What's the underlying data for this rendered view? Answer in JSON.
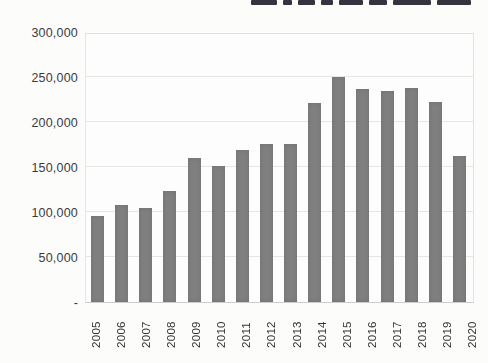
{
  "chart_data": {
    "type": "bar",
    "title": "",
    "title_note": "title cropped out of frame; only bottom sliver of bold letters visible",
    "xlabel": "",
    "ylabel": "",
    "categories": [
      "2005",
      "2006",
      "2007",
      "2008",
      "2009",
      "2010",
      "2011",
      "2012",
      "2013",
      "2014",
      "2015",
      "2016",
      "2017",
      "2018",
      "2019",
      "2020"
    ],
    "values": [
      95000,
      108000,
      104000,
      123000,
      160000,
      151000,
      169000,
      176000,
      176000,
      221000,
      250000,
      237000,
      234000,
      238000,
      222000,
      162000
    ],
    "ylim": [
      0,
      300000
    ],
    "y_tick_step": 50000,
    "y_tick_labels_topdown": [
      "300,000",
      "250,000",
      "200,000",
      "150,000",
      "100,000",
      "50,000",
      "-"
    ],
    "grid": true,
    "legend_position": "none",
    "bar_color": "#7f7f7f",
    "gridline_color": "#e6e6e5",
    "axis_label_color": "#3b3b3b"
  }
}
